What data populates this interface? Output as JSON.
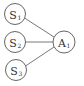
{
  "diagram": {
    "nodes": [
      {
        "id": "S1",
        "base": "S",
        "sub": "1",
        "cx": 15,
        "cy": 14,
        "r": 10.5
      },
      {
        "id": "S2",
        "base": "S",
        "sub": "2",
        "cx": 15,
        "cy": 42,
        "r": 10.5
      },
      {
        "id": "S3",
        "base": "S",
        "sub": "3",
        "cx": 16,
        "cy": 70,
        "r": 10.5
      },
      {
        "id": "A1",
        "base": "A",
        "sub": "1",
        "cx": 64,
        "cy": 42,
        "r": 11
      }
    ],
    "edges": [
      {
        "from": "S1",
        "to": "A1"
      },
      {
        "from": "S2",
        "to": "A1"
      },
      {
        "from": "S3",
        "to": "A1"
      }
    ],
    "colors": {
      "stroke": "#555555",
      "text": "#333333",
      "background": "#ffffff"
    }
  }
}
